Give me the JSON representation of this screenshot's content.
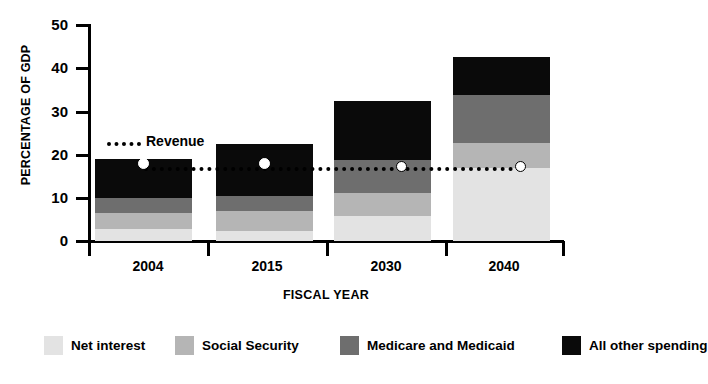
{
  "chart_data": {
    "type": "bar",
    "stacked": true,
    "title": "",
    "xlabel": "FISCAL YEAR",
    "ylabel": "PERCENTAGE OF GDP",
    "categories": [
      "2004",
      "2015",
      "2030",
      "2040"
    ],
    "ylim": [
      0,
      50
    ],
    "yticks": [
      0,
      10,
      20,
      30,
      40,
      50
    ],
    "ytick_labels": [
      "0",
      "10",
      "20",
      "30",
      "40",
      "50"
    ],
    "grid": false,
    "legend_position": "bottom",
    "series": [
      {
        "name": "Net interest",
        "color": "#e3e3e3",
        "values": [
          3.0,
          2.4,
          6.0,
          17.1
        ]
      },
      {
        "name": "Social Security",
        "color": "#b5b5b5",
        "values": [
          3.7,
          4.6,
          5.3,
          5.6
        ]
      },
      {
        "name": "Medicare and Medicaid",
        "color": "#6e6e6e",
        "values": [
          3.3,
          3.5,
          7.5,
          11.1
        ]
      },
      {
        "name": "All other spending",
        "color": "#0a0a0a",
        "values": [
          9.2,
          12.0,
          13.8,
          8.8
        ]
      }
    ],
    "totals": [
      19.2,
      22.5,
      32.6,
      42.6
    ],
    "annotations": [
      {
        "name": "Revenue",
        "label": "Revenue",
        "type": "dotted-line-with-markers",
        "value": 17.3,
        "marker_values": [
          17.3,
          17.3,
          17.3,
          17.3
        ],
        "color": "#000000"
      }
    ]
  },
  "axes": {
    "y_title": "PERCENTAGE OF GDP",
    "x_title": "FISCAL YEAR",
    "y_ticks": [
      "50",
      "40",
      "30",
      "20",
      "10",
      "0"
    ],
    "x_ticks": [
      "2004",
      "2015",
      "2030",
      "2040"
    ]
  },
  "legend": {
    "items": [
      {
        "label": "Net interest",
        "color": "#e3e3e3"
      },
      {
        "label": "Social Security",
        "color": "#b5b5b5"
      },
      {
        "label": "Medicare and Medicaid",
        "color": "#6e6e6e"
      },
      {
        "label": "All other spending",
        "color": "#0a0a0a"
      }
    ]
  },
  "revenue": {
    "label": "Revenue"
  }
}
